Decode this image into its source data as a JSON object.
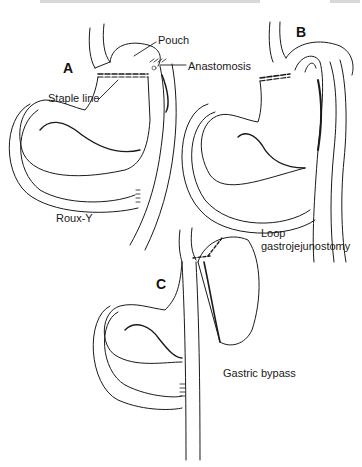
{
  "figure": {
    "panels": [
      {
        "id": "A",
        "letter": "A",
        "procedure": "Roux-Y",
        "callouts": [
          "Pouch",
          "Anastomosis",
          "Staple line"
        ]
      },
      {
        "id": "B",
        "letter": "B",
        "procedure_line1": "Loop",
        "procedure_line2": "gastrojejunostomy"
      },
      {
        "id": "C",
        "letter": "C",
        "procedure": "Gastric bypass"
      }
    ],
    "colors": {
      "line": "#1a1a1a",
      "background": "#ffffff"
    }
  }
}
